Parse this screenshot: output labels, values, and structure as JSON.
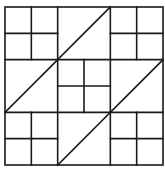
{
  "diagram": {
    "title": "",
    "line_color": "#1a1a1a",
    "background": "#ffffff",
    "cells": [
      {
        "row": 0,
        "col": 0,
        "type": "four-patch"
      },
      {
        "row": 0,
        "col": 1,
        "type": "half-square-triangle",
        "diagonal": "bottom-left-to-top-right"
      },
      {
        "row": 0,
        "col": 2,
        "type": "four-patch"
      },
      {
        "row": 1,
        "col": 0,
        "type": "half-square-triangle",
        "diagonal": "bottom-left-to-top-right"
      },
      {
        "row": 1,
        "col": 1,
        "type": "four-patch"
      },
      {
        "row": 1,
        "col": 2,
        "type": "half-square-triangle",
        "diagonal": "bottom-left-to-top-right"
      },
      {
        "row": 2,
        "col": 0,
        "type": "four-patch"
      },
      {
        "row": 2,
        "col": 1,
        "type": "half-square-triangle",
        "diagonal": "bottom-left-to-top-right"
      },
      {
        "row": 2,
        "col": 2,
        "type": "four-patch"
      }
    ]
  }
}
